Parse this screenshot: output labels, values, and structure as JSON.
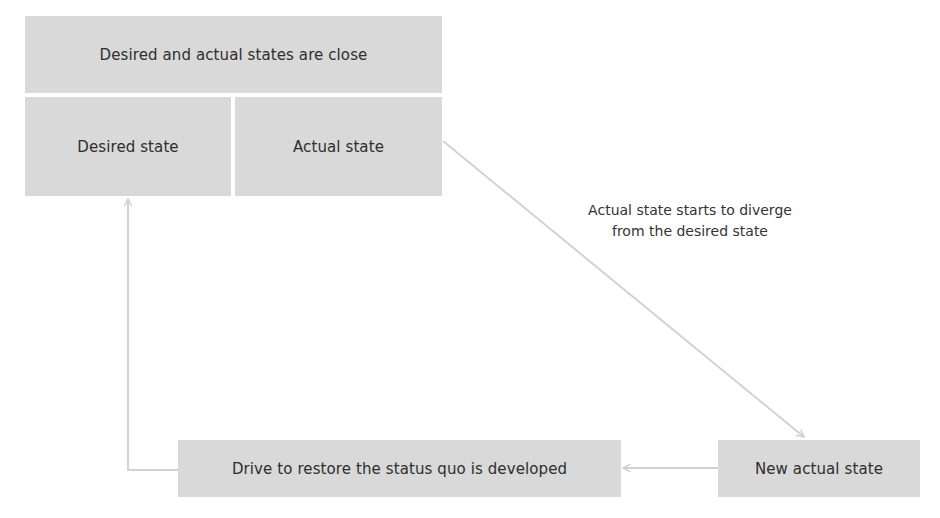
{
  "diagram": {
    "title_box": {
      "label": "Desired and actual states are close"
    },
    "desired_state": {
      "label": "Desired state"
    },
    "actual_state": {
      "label": "Actual state"
    },
    "diverge_annotation": {
      "line1": "Actual state starts to diverge",
      "line2": "from the desired state"
    },
    "new_actual_state": {
      "label": "New actual state"
    },
    "drive_box": {
      "label": "Drive to restore the status quo is developed"
    },
    "edges": [
      {
        "from": "actual_state",
        "to": "new_actual_state",
        "label": "Actual state starts to diverge from the desired state"
      },
      {
        "from": "new_actual_state",
        "to": "drive_box"
      },
      {
        "from": "drive_box",
        "to": "desired_state"
      }
    ],
    "colors": {
      "box_fill": "#d9d9d9",
      "connector": "#cfcfcf",
      "text": "#2e2e2e"
    }
  }
}
